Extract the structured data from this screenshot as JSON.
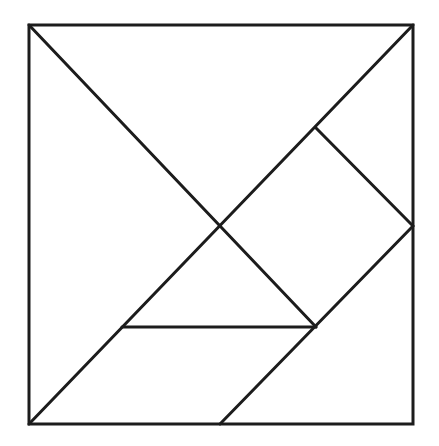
{
  "diagram": {
    "stroke_color": "#1c1c1c",
    "background": "#ffffff",
    "stroke_width": 3,
    "outer_square": {
      "x": 29,
      "y": 25,
      "width": 384,
      "height": 399
    },
    "segments": [
      {
        "name": "main-diagonal-tl-br",
        "x1": 29,
        "y1": 25,
        "x2": 316,
        "y2": 327
      },
      {
        "name": "anti-diagonal-bl-tr",
        "x1": 29,
        "y1": 424,
        "x2": 413,
        "y2": 25
      },
      {
        "name": "square-edge-upper",
        "x1": 316,
        "y1": 128,
        "x2": 413,
        "y2": 226
      },
      {
        "name": "parallelogram-edge-right",
        "x1": 413,
        "y1": 226,
        "x2": 220,
        "y2": 424
      },
      {
        "name": "small-triangle-base",
        "x1": 122,
        "y1": 327,
        "x2": 316,
        "y2": 327
      }
    ]
  }
}
